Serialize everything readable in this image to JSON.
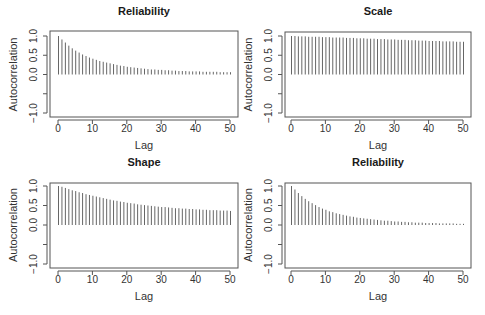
{
  "chart_data": [
    {
      "type": "bar",
      "title": "Reliability",
      "xlabel": "Lag",
      "ylabel": "Autocorrelation",
      "xlim": [
        0,
        50
      ],
      "ylim": [
        -1,
        1
      ],
      "xticks": [
        "0",
        "10",
        "20",
        "30",
        "40",
        "50"
      ],
      "yticks": [
        "-1.0",
        "-0.5",
        "0.0",
        "0.5",
        "1.0"
      ],
      "ytick_labels_shown": [
        "-1.0",
        "0.0",
        "0.5",
        "1.0"
      ],
      "grid": false,
      "x": [
        0,
        1,
        2,
        3,
        4,
        5,
        6,
        7,
        8,
        9,
        10,
        11,
        12,
        13,
        14,
        15,
        16,
        17,
        18,
        19,
        20,
        21,
        22,
        23,
        24,
        25,
        26,
        27,
        28,
        29,
        30,
        31,
        32,
        33,
        34,
        35,
        36,
        37,
        38,
        39,
        40,
        41,
        42,
        43,
        44,
        45,
        46,
        47,
        48,
        49,
        50
      ],
      "values": [
        1.0,
        0.91,
        0.83,
        0.75,
        0.68,
        0.62,
        0.57,
        0.52,
        0.48,
        0.44,
        0.41,
        0.38,
        0.35,
        0.33,
        0.31,
        0.29,
        0.27,
        0.25,
        0.23,
        0.22,
        0.2,
        0.19,
        0.18,
        0.17,
        0.16,
        0.15,
        0.14,
        0.13,
        0.13,
        0.12,
        0.12,
        0.11,
        0.11,
        0.1,
        0.1,
        0.09,
        0.09,
        0.09,
        0.08,
        0.08,
        0.08,
        0.08,
        0.07,
        0.07,
        0.07,
        0.07,
        0.07,
        0.06,
        0.06,
        0.06,
        0.06
      ]
    },
    {
      "type": "bar",
      "title": "Scale",
      "xlabel": "Lag",
      "ylabel": "Autocorrelation",
      "xlim": [
        0,
        50
      ],
      "ylim": [
        -1,
        1
      ],
      "xticks": [
        "0",
        "10",
        "20",
        "30",
        "40",
        "50"
      ],
      "yticks": [
        "-1.0",
        "-0.5",
        "0.0",
        "0.5",
        "1.0"
      ],
      "ytick_labels_shown": [
        "-1.0",
        "0.0",
        "0.5",
        "1.0"
      ],
      "grid": false,
      "x": [
        0,
        1,
        2,
        3,
        4,
        5,
        6,
        7,
        8,
        9,
        10,
        11,
        12,
        13,
        14,
        15,
        16,
        17,
        18,
        19,
        20,
        21,
        22,
        23,
        24,
        25,
        26,
        27,
        28,
        29,
        30,
        31,
        32,
        33,
        34,
        35,
        36,
        37,
        38,
        39,
        40,
        41,
        42,
        43,
        44,
        45,
        46,
        47,
        48,
        49,
        50
      ],
      "values": [
        1.0,
        1.0,
        0.99,
        0.99,
        0.99,
        0.98,
        0.98,
        0.98,
        0.98,
        0.97,
        0.97,
        0.97,
        0.96,
        0.96,
        0.96,
        0.96,
        0.95,
        0.95,
        0.95,
        0.94,
        0.94,
        0.94,
        0.93,
        0.93,
        0.93,
        0.92,
        0.92,
        0.92,
        0.91,
        0.91,
        0.91,
        0.9,
        0.9,
        0.9,
        0.89,
        0.89,
        0.89,
        0.88,
        0.88,
        0.88,
        0.87,
        0.87,
        0.87,
        0.87,
        0.86,
        0.86,
        0.86,
        0.86,
        0.85,
        0.85,
        0.85
      ]
    },
    {
      "type": "bar",
      "title": "Shape",
      "xlabel": "Lag",
      "ylabel": "Autocorrelation",
      "xlim": [
        0,
        50
      ],
      "ylim": [
        -1,
        1
      ],
      "xticks": [
        "0",
        "10",
        "20",
        "30",
        "40",
        "50"
      ],
      "yticks": [
        "-1.0",
        "-0.5",
        "0.0",
        "0.5",
        "1.0"
      ],
      "ytick_labels_shown": [
        "-1.0",
        "0.0",
        "0.5",
        "1.0"
      ],
      "grid": false,
      "x": [
        0,
        1,
        2,
        3,
        4,
        5,
        6,
        7,
        8,
        9,
        10,
        11,
        12,
        13,
        14,
        15,
        16,
        17,
        18,
        19,
        20,
        21,
        22,
        23,
        24,
        25,
        26,
        27,
        28,
        29,
        30,
        31,
        32,
        33,
        34,
        35,
        36,
        37,
        38,
        39,
        40,
        41,
        42,
        43,
        44,
        45,
        46,
        47,
        48,
        49,
        50
      ],
      "values": [
        1.0,
        0.98,
        0.95,
        0.92,
        0.89,
        0.87,
        0.84,
        0.82,
        0.79,
        0.77,
        0.75,
        0.73,
        0.71,
        0.69,
        0.67,
        0.65,
        0.63,
        0.62,
        0.6,
        0.59,
        0.57,
        0.56,
        0.55,
        0.53,
        0.52,
        0.51,
        0.5,
        0.49,
        0.48,
        0.47,
        0.46,
        0.46,
        0.45,
        0.44,
        0.43,
        0.43,
        0.42,
        0.42,
        0.41,
        0.41,
        0.4,
        0.4,
        0.39,
        0.39,
        0.38,
        0.38,
        0.38,
        0.37,
        0.37,
        0.37,
        0.36
      ]
    },
    {
      "type": "bar",
      "title": "Reliability",
      "xlabel": "Lag",
      "ylabel": "Autocorrelation",
      "xlim": [
        0,
        50
      ],
      "ylim": [
        -1,
        1
      ],
      "xticks": [
        "0",
        "10",
        "20",
        "30",
        "40",
        "50"
      ],
      "yticks": [
        "-1.0",
        "-0.5",
        "0.0",
        "0.5",
        "1.0"
      ],
      "ytick_labels_shown": [
        "-1.0",
        "0.0",
        "0.5",
        "1.0"
      ],
      "grid": false,
      "x": [
        0,
        1,
        2,
        3,
        4,
        5,
        6,
        7,
        8,
        9,
        10,
        11,
        12,
        13,
        14,
        15,
        16,
        17,
        18,
        19,
        20,
        21,
        22,
        23,
        24,
        25,
        26,
        27,
        28,
        29,
        30,
        31,
        32,
        33,
        34,
        35,
        36,
        37,
        38,
        39,
        40,
        41,
        42,
        43,
        44,
        45,
        46,
        47,
        48,
        49,
        50
      ],
      "values": [
        1.0,
        0.91,
        0.82,
        0.74,
        0.67,
        0.61,
        0.56,
        0.51,
        0.46,
        0.42,
        0.39,
        0.35,
        0.33,
        0.3,
        0.28,
        0.26,
        0.24,
        0.22,
        0.21,
        0.19,
        0.18,
        0.17,
        0.16,
        0.15,
        0.14,
        0.13,
        0.12,
        0.11,
        0.11,
        0.1,
        0.09,
        0.09,
        0.08,
        0.08,
        0.07,
        0.07,
        0.06,
        0.06,
        0.06,
        0.05,
        0.05,
        0.05,
        0.05,
        0.04,
        0.04,
        0.04,
        0.04,
        0.04,
        0.03,
        0.03,
        0.03
      ]
    }
  ]
}
